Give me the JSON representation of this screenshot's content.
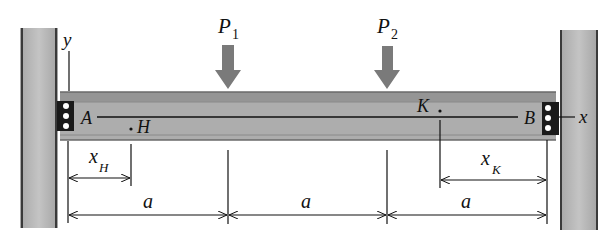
{
  "figure": {
    "type": "beam-diagram",
    "colors": {
      "column_fill": "#b4b4b4",
      "column_edge": "#3a3a3a",
      "beam_fill": "#adadad",
      "beam_flange": "#8e8e8e",
      "load_arrow": "#7a7a7a",
      "bolt_plate": "#1a1a1a",
      "line": "#111111"
    }
  },
  "axes": {
    "y_label": "y",
    "x_label": "x"
  },
  "supports": {
    "left_label": "A",
    "right_label": "B"
  },
  "loads": [
    {
      "symbol": "P",
      "subscript": "1"
    },
    {
      "symbol": "P",
      "subscript": "2"
    }
  ],
  "points": [
    {
      "label": "H"
    },
    {
      "label": "K"
    }
  ],
  "dimensions": {
    "x_H": {
      "symbol": "x",
      "subscript": "H"
    },
    "x_K": {
      "symbol": "x",
      "subscript": "K"
    },
    "spans": [
      "a",
      "a",
      "a"
    ]
  }
}
